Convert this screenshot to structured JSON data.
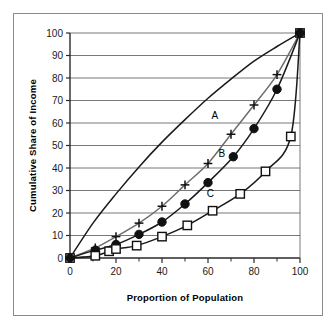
{
  "chart_data": {
    "type": "line",
    "title": "",
    "xlabel": "Proportion of Population",
    "ylabel": "Cumulative Share of Income",
    "xlim": [
      0,
      100
    ],
    "ylim": [
      0,
      100
    ],
    "xticks": [
      0,
      20,
      40,
      60,
      80,
      100
    ],
    "xtick_labels": [
      "0",
      "20",
      "40",
      "60",
      "80",
      "100"
    ],
    "xminor_ticks": [
      10,
      30,
      50,
      70,
      90
    ],
    "yticks": [
      0,
      10,
      20,
      30,
      40,
      50,
      60,
      70,
      80,
      90,
      100
    ],
    "ytick_labels": [
      "0",
      "10",
      "20",
      "30",
      "40",
      "50",
      "60",
      "70",
      "80",
      "90",
      "100"
    ],
    "grid": "horizontal",
    "legend": "inline-labels",
    "annotations": [
      {
        "text": "A",
        "x": 63,
        "y": 62
      },
      {
        "text": "B",
        "x": 66,
        "y": 45
      },
      {
        "text": "C",
        "x": 61,
        "y": 27
      }
    ],
    "series": [
      {
        "name": "A",
        "marker": "none",
        "color": "#1a1a1a",
        "x": [
          0,
          10,
          20,
          30,
          40,
          50,
          60,
          70,
          80,
          90,
          100
        ],
        "y": [
          0,
          15.5,
          28.5,
          40.5,
          51.5,
          61.5,
          71.0,
          79.5,
          87.5,
          94.0,
          100
        ]
      },
      {
        "name": "B-plus",
        "marker": "plus",
        "color": "#6e6e6e",
        "x": [
          0,
          11,
          20,
          30,
          40,
          50,
          60,
          70,
          80,
          90,
          100
        ],
        "y": [
          0,
          4.5,
          9.5,
          15.5,
          23.0,
          32.5,
          42.0,
          55.0,
          68.0,
          81.5,
          100
        ]
      },
      {
        "name": "B-circle",
        "marker": "circle",
        "color": "#1a1a1a",
        "x": [
          0,
          11,
          20,
          30,
          40,
          50,
          60,
          71,
          80,
          90,
          100
        ],
        "y": [
          0,
          3.5,
          6.0,
          10.5,
          16.0,
          24.0,
          33.5,
          45.0,
          57.5,
          75.0,
          100
        ]
      },
      {
        "name": "C",
        "marker": "square",
        "color": "#1a1a1a",
        "x": [
          0,
          11,
          17,
          20,
          29,
          40,
          51,
          62,
          74,
          85,
          96,
          100
        ],
        "y": [
          0,
          1.0,
          3.0,
          4.0,
          5.5,
          9.5,
          14.5,
          21.0,
          28.5,
          38.5,
          54.0,
          100
        ]
      }
    ]
  },
  "axis": {
    "x_title": "Proportion of Population",
    "y_title": "Cumulative Share of Income"
  },
  "labels": {
    "a": "A",
    "b": "B",
    "c": "C"
  }
}
